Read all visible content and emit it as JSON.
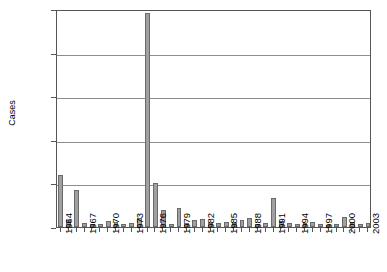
{
  "chart_data": {
    "type": "bar",
    "title": "",
    "subtitle": "",
    "xlabel": "",
    "ylabel": "Cases",
    "ylim": [
      0,
      2000
    ],
    "yticks": [
      0,
      400,
      800,
      1200,
      1600,
      2000
    ],
    "grid": true,
    "legend": false,
    "legend_position": "none",
    "bar_color": "#a0a0a0",
    "bar_edge_color": "#6a6a6a",
    "axis_color": "#555555",
    "gridline_color": "#8d8d8d",
    "categories": [
      "1964",
      "1965",
      "1966",
      "1967",
      "1968",
      "1969",
      "1970",
      "1971",
      "1972",
      "1973",
      "1974",
      "1975",
      "1976",
      "1977",
      "1978",
      "1979",
      "1980",
      "1981",
      "1982",
      "1983",
      "1984",
      "1985",
      "1986",
      "1987",
      "1988",
      "1989",
      "1990",
      "1991",
      "1992",
      "1993",
      "1994",
      "1995",
      "1996",
      "1997",
      "1998",
      "1999",
      "2000",
      "2001",
      "2002",
      "2003"
    ],
    "values": [
      480,
      60,
      340,
      35,
      30,
      25,
      55,
      45,
      30,
      35,
      80,
      1960,
      400,
      160,
      30,
      175,
      40,
      60,
      70,
      40,
      35,
      45,
      35,
      60,
      80,
      25,
      40,
      265,
      55,
      35,
      25,
      40,
      45,
      25,
      20,
      30,
      95,
      45,
      25,
      40
    ],
    "xtick_labels": [
      "1964",
      "1967",
      "1970",
      "1973",
      "1976",
      "1979",
      "1982",
      "1985",
      "1988",
      "1991",
      "1994",
      "1997",
      "2000",
      "2003"
    ]
  }
}
